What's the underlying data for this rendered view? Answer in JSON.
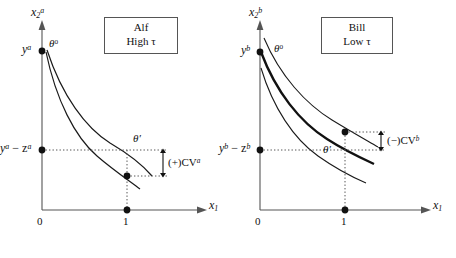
{
  "figure": {
    "panels": [
      {
        "id": "alf",
        "box": {
          "name": "Alf",
          "tau_line": "High τ"
        },
        "axes": {
          "y_axis_label": "x",
          "y_axis_sub": "2",
          "y_axis_sup": "a",
          "x_axis_label": "x",
          "x_axis_sub": "1",
          "x_ticks": [
            "0",
            "1"
          ]
        },
        "labels": {
          "endowment": "y",
          "endowment_sup": "a",
          "net_income": "y",
          "net_income_sup": "a",
          "net_income_minus": " − z",
          "net_income_sup2": "a",
          "theta_initial": "θ",
          "theta_initial_sup": "o",
          "theta_prime": "θ′",
          "cv_bracket": "(+)CV",
          "cv_bracket_sup": "a"
        }
      },
      {
        "id": "bill",
        "box": {
          "name": "Bill",
          "tau_line": "Low τ"
        },
        "axes": {
          "y_axis_label": "x",
          "y_axis_sub": "2",
          "y_axis_sup": "b",
          "x_axis_label": "x",
          "x_axis_sub": "1",
          "x_ticks": [
            "0",
            "1"
          ]
        },
        "labels": {
          "endowment": "y",
          "endowment_sup": "b",
          "net_income": "y",
          "net_income_sup": "b",
          "net_income_minus": " − z",
          "net_income_sup2": "b",
          "theta_initial": "θ",
          "theta_initial_sup": "o",
          "theta_prime": "θ′",
          "cv_bracket": "(−)CV",
          "cv_bracket_sup": "b"
        }
      }
    ],
    "colors": {
      "axis": "#555555",
      "curve": "#1a1a1a",
      "dotted": "#555555",
      "box_border": "#555555",
      "ink": "#111111"
    }
  }
}
